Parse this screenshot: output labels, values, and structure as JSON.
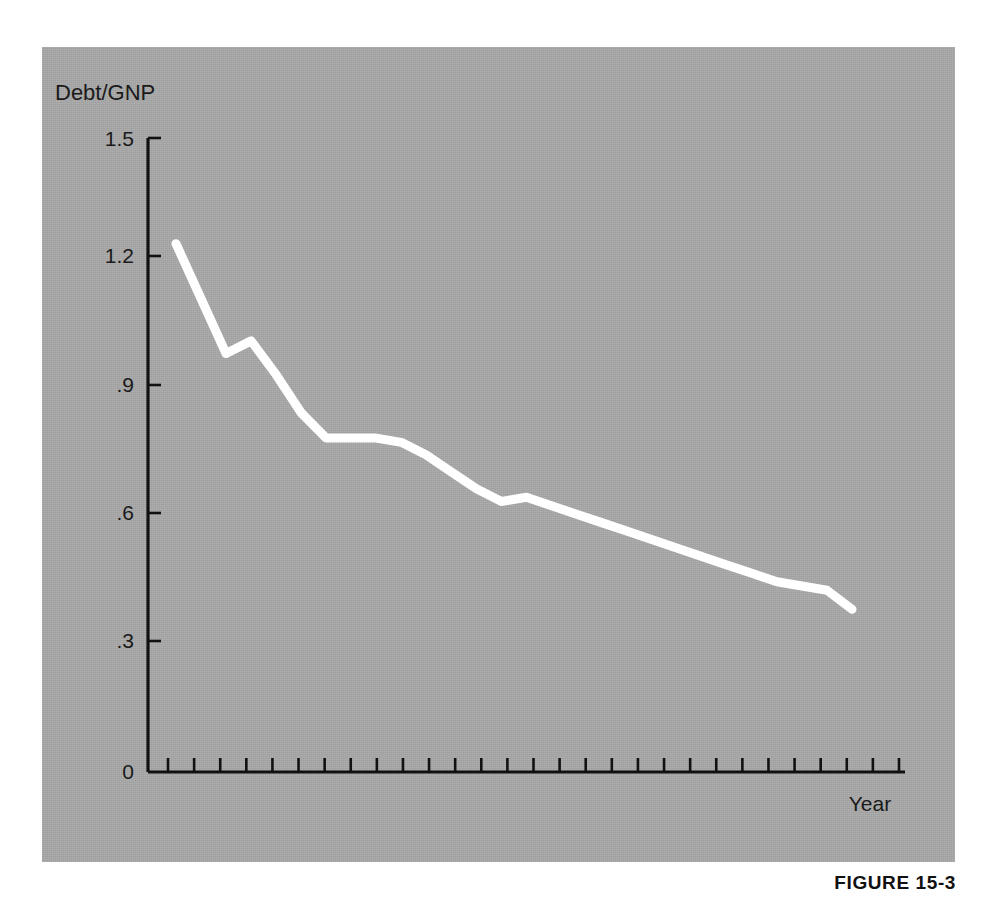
{
  "figure": {
    "caption": "FIGURE 15-3",
    "plate_color": "#a8a8a8",
    "line_color": "#ffffff",
    "axis_color": "#111111"
  },
  "chart_data": {
    "type": "line",
    "title": "",
    "subtitle": "",
    "ylabel": "Debt/GNP",
    "xlabel": "Year",
    "ylim": [
      0,
      1.5
    ],
    "yticks": [
      0,
      0.3,
      0.6,
      0.9,
      1.2,
      1.5
    ],
    "ytick_labels": [
      "0",
      ".3",
      ".6",
      ".9",
      "1.2",
      "1.5"
    ],
    "xticks_count": 29,
    "xtick_labels": [],
    "grid": false,
    "legend": null,
    "series": [
      {
        "name": "Debt/GNP ratio",
        "x": [
          0,
          1,
          2,
          3,
          4,
          5,
          6,
          7,
          8,
          9,
          10,
          11,
          12,
          13,
          14,
          15,
          16,
          17,
          18,
          19,
          20,
          21,
          22,
          23,
          24,
          25,
          26,
          27
        ],
        "values": [
          1.25,
          1.12,
          0.99,
          1.02,
          0.94,
          0.85,
          0.79,
          0.79,
          0.79,
          0.78,
          0.75,
          0.71,
          0.67,
          0.64,
          0.65,
          0.63,
          0.61,
          0.59,
          0.57,
          0.55,
          0.53,
          0.51,
          0.49,
          0.47,
          0.45,
          0.44,
          0.43,
          0.385
        ]
      }
    ]
  },
  "axes": {
    "y_axis_label": "Debt/GNP",
    "x_axis_label": "Year",
    "y_tick_values": [
      "1.5",
      "1.2",
      ".9",
      ".6",
      ".3",
      "0"
    ]
  }
}
